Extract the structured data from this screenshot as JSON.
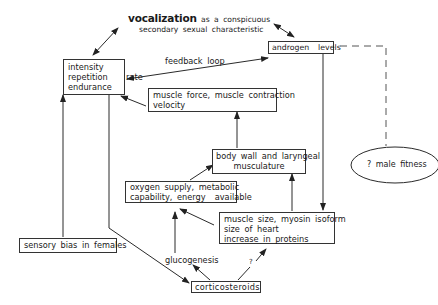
{
  "title": {
    "emphasis": "vocalization",
    "line1_rest": " as a conspicuous",
    "line2": "secondary sexual characteristic"
  },
  "nodes": {
    "performance": {
      "lines": [
        "intensity",
        "repetition    rate",
        "endurance"
      ]
    },
    "androgen": {
      "lines": [
        "androgen  levels"
      ]
    },
    "muscle_force": {
      "lines": [
        "muscle force, muscle contraction",
        "velocity"
      ]
    },
    "body_wall": {
      "lines": [
        "body wall and laryngeal",
        "musculature"
      ]
    },
    "oxygen": {
      "lines": [
        "oxygen supply, metabolic",
        "capability, energy  available"
      ]
    },
    "muscle_size": {
      "lines": [
        "muscle size, myosin isoform",
        "size of heart",
        "increase in proteins"
      ]
    },
    "sensory_bias": {
      "lines": [
        "sensory bias in females"
      ]
    },
    "corticosteroids": {
      "lines": [
        "corticosteroids"
      ]
    },
    "male_fitness": {
      "label": "? male fitness"
    }
  },
  "edge_labels": {
    "feedback_loop": "feedback loop",
    "glucogenesis": "glucogenesis",
    "question": "?"
  },
  "colors": {
    "line": "#2a2a2a",
    "text": "#1a1a1a",
    "dashed": "#555555"
  }
}
